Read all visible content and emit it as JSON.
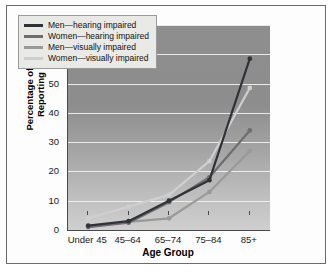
{
  "chart_data": {
    "type": "line",
    "title": "",
    "xlabel": "Age Group",
    "ylabel": "Percentage of Individuals Reporting Difficulty",
    "ylabel_line1": "Percentage of Individuals",
    "ylabel_line2": "Reporting Difficulty",
    "categories": [
      "Under 45",
      "45–64",
      "65–74",
      "75–84",
      "85+"
    ],
    "ylim": [
      0,
      70
    ],
    "yticks": [
      0,
      10,
      20,
      30,
      40,
      50,
      60,
      70
    ],
    "grid": true,
    "legend_position": "top-left",
    "series": [
      {
        "name": "Men—hearing impaired",
        "color": "#2f3338",
        "values": [
          1.5,
          3.0,
          10.0,
          17.0,
          58.5
        ]
      },
      {
        "name": "Women—hearing impaired",
        "color": "#6e6e6e",
        "values": [
          1.0,
          2.5,
          9.5,
          18.0,
          34.0
        ]
      },
      {
        "name": "Men—visually impaired",
        "color": "#9a9a9a",
        "values": [
          1.2,
          2.8,
          4.0,
          13.0,
          27.0
        ]
      },
      {
        "name": "Women—visually impaired",
        "color": "#cfcfcf",
        "values": [
          4.0,
          8.0,
          12.0,
          23.5,
          48.5
        ]
      }
    ]
  },
  "legend": {
    "items": [
      {
        "label": "Men—hearing impaired",
        "color": "#2f3338"
      },
      {
        "label": "Women—hearing impaired",
        "color": "#6e6e6e"
      },
      {
        "label": "Men—visually impaired",
        "color": "#9a9a9a"
      },
      {
        "label": "Women—visually impaired",
        "color": "#cfcfcf"
      }
    ]
  }
}
